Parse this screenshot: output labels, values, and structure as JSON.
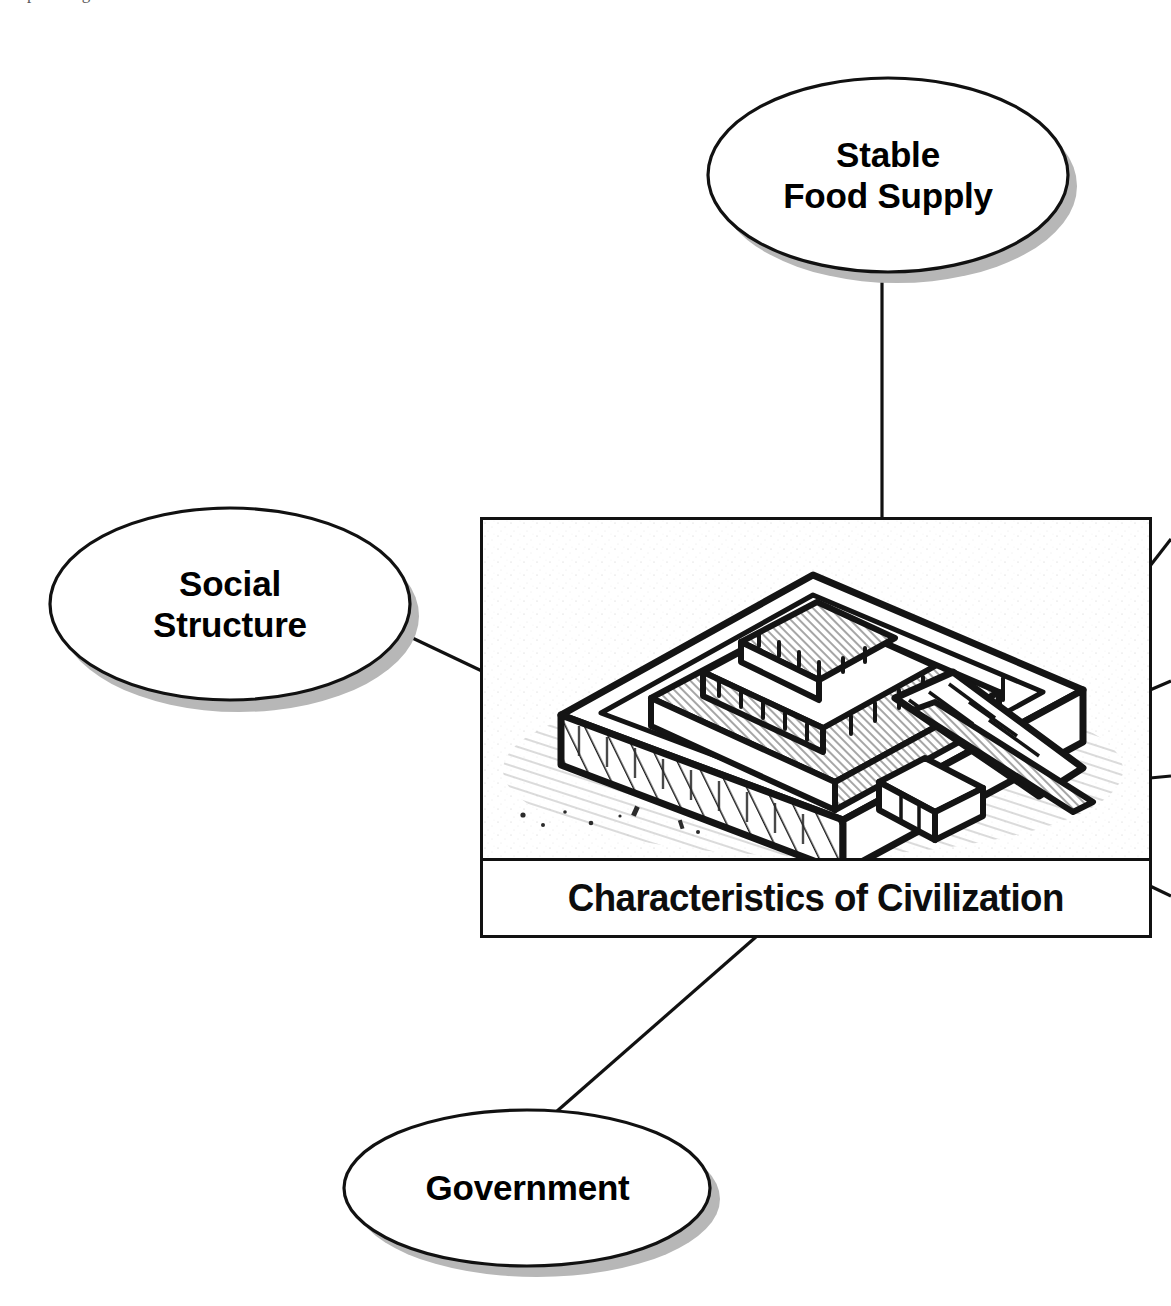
{
  "page": {
    "clipped_header_remnant": "Graphic Organizer",
    "background_color": "#ffffff",
    "ink_color": "#111111",
    "shadow_color": "#b5b5b5"
  },
  "diagram": {
    "type": "concept-web",
    "center": {
      "caption": "Characteristics of Civilization",
      "illustration_name": "ziggurat-line-drawing",
      "illustration_description": "Pen-and-ink drawing of a stepped ziggurat with terraces, staircases and stone blocks"
    },
    "nodes": [
      {
        "id": "stable-food-supply",
        "lines": [
          "Stable",
          "Food Supply"
        ],
        "position": "top",
        "shape": "ellipse"
      },
      {
        "id": "social-structure",
        "lines": [
          "Social",
          "Structure"
        ],
        "position": "left",
        "shape": "ellipse"
      },
      {
        "id": "government",
        "lines": [
          "Government"
        ],
        "position": "bottom",
        "shape": "ellipse"
      }
    ],
    "offscreen_connectors": {
      "count": 4,
      "edge": "right",
      "note": "Four connector stubs exit the right edge of the central card toward nodes cropped out of frame"
    }
  }
}
